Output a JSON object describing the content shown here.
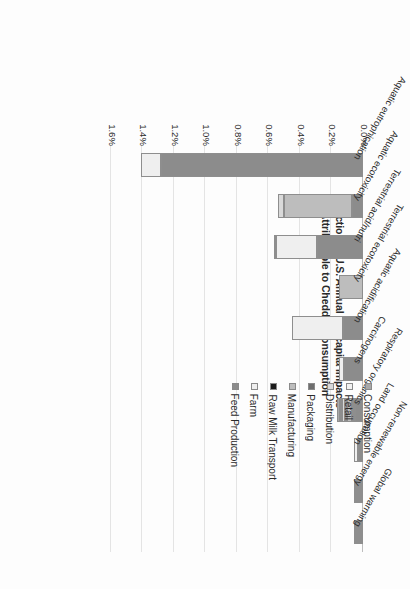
{
  "chart_data": {
    "type": "bar",
    "orientation": "horizontal-stacked",
    "title": "",
    "xlabel": "Fraction of U.S. Annual Per-capita Impacts Attributable to Cheddar Consumption",
    "ylabel": "",
    "xlim": [
      0.0,
      1.6
    ],
    "xtick_labels": [
      "0.0%",
      "0.2%",
      "0.4%",
      "0.6%",
      "0.8%",
      "1.0%",
      "1.2%",
      "1.4%",
      "1.6%"
    ],
    "xtick_values": [
      0.0,
      0.2,
      0.4,
      0.6,
      0.8,
      1.0,
      1.2,
      1.4,
      1.6
    ],
    "grid": true,
    "legend_position": "upper-right",
    "units": "percent",
    "categories": [
      "Aquatic eutrophication",
      "Aquatic ecotoxicity",
      "Terrestrial acid/nutri",
      "Terrestrial ecotoxicity",
      "Aquatic acidification",
      "Carcinogens",
      "Respiratory organics",
      "Land occupation",
      "Non-renewable energy",
      "Global warming"
    ],
    "series": [
      {
        "name": "Feed Production",
        "color": "#8c8c8c",
        "values": [
          1.28,
          0.07,
          0.29,
          0.0,
          0.13,
          0.12,
          0.05,
          0.03,
          0.015,
          0.01
        ]
      },
      {
        "name": "Farm",
        "color": "#efefef",
        "values": [
          0.13,
          0.0,
          0.26,
          0.0,
          0.32,
          0.03,
          0.015,
          0.03,
          0.008,
          0.015
        ]
      },
      {
        "name": "Raw Milk Transport",
        "color": "#1a1a1a",
        "values": [
          0.0,
          0.0,
          0.0,
          0.0,
          0.0,
          0.0,
          0.004,
          0.0,
          0.002,
          0.002
        ]
      },
      {
        "name": "Manufacturing",
        "color": "#bdbdbd",
        "values": [
          0.0,
          0.43,
          0.01,
          0.15,
          0.0,
          0.0,
          0.035,
          0.0,
          0.006,
          0.006
        ]
      },
      {
        "name": "Packaging",
        "color": "#6e6e6e",
        "values": [
          0.0,
          0.0,
          0.0,
          0.0,
          0.0,
          0.0,
          0.012,
          0.0,
          0.004,
          0.004
        ]
      },
      {
        "name": "Distribution",
        "color": "#d9d9d9",
        "values": [
          0.0,
          0.04,
          0.0,
          0.0,
          0.0,
          0.0,
          0.02,
          0.0,
          0.005,
          0.005
        ]
      },
      {
        "name": "Retail",
        "color": "#f2f2f2",
        "values": [
          0.0,
          0.0,
          0.0,
          0.0,
          0.0,
          0.0,
          0.01,
          0.0,
          0.004,
          0.004
        ]
      },
      {
        "name": "Consumption",
        "color": "#a8a8a8",
        "values": [
          0.0,
          0.0,
          0.0,
          0.0,
          0.0,
          0.0,
          0.018,
          0.0,
          0.006,
          0.006
        ]
      }
    ],
    "totals": [
      1.41,
      0.54,
      0.56,
      0.15,
      0.45,
      0.15,
      0.164,
      0.06,
      0.05,
      0.052
    ],
    "annotations": []
  },
  "legend": {
    "items": [
      {
        "label": "Consumption",
        "color": "#a8a8a8"
      },
      {
        "label": "Retail",
        "color": "#f2f2f2"
      },
      {
        "label": "Distribution",
        "color": "#d9d9d9"
      },
      {
        "label": "Packaging",
        "color": "#6e6e6e"
      },
      {
        "label": "Manufacturing",
        "color": "#bdbdbd"
      },
      {
        "label": "Raw Milk Transport",
        "color": "#1a1a1a"
      },
      {
        "label": "Farm",
        "color": "#efefef"
      },
      {
        "label": "Feed Production",
        "color": "#8c8c8c"
      }
    ]
  },
  "axis": {
    "title_line1": "Fraction of U.S. Annual Per-capita Impacts",
    "title_line2": "Attributable to Cheddar Consumption"
  },
  "colors": {
    "gridline": "#e4e4e4",
    "axis_line": "#bdbdbd",
    "text": "#2a2a2a",
    "background": "#fdfdfd"
  }
}
